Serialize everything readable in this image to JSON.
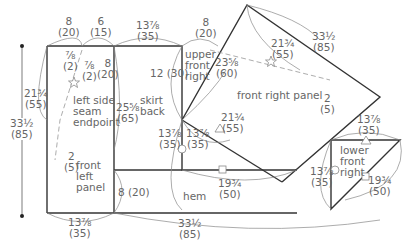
{
  "diagram": {
    "type": "sewing-pattern",
    "panels": {
      "front_left": "front\nleft\npanel",
      "skirt_back": "skirt\nback",
      "upper_front_right": "upper\nfront\nright",
      "front_right": "front right panel",
      "lower_front_right": "lower\nfront\nright",
      "hem": "hem",
      "left_side_seam": "left side\nseam\nendpoint"
    },
    "measurements": {
      "top_left_width": "8\n(20)",
      "top_mid_width": "6\n(15)",
      "top_back_width": "13⅞\n(35)",
      "top_upper_right_width": "8\n(20)",
      "dart_left": "⅞\n(2)",
      "dart_right": "⅞\n(2)",
      "back_upper_height": "8\n(20)",
      "left_panel_height": "21¾\n(55)",
      "total_height": "33½\n(85)",
      "seam_offset": "2\n(5)",
      "back_side_length": "25⅝\n(65)",
      "upper_right_height": "12 (30)",
      "diagonal_upper": "23⅝\n(60)",
      "front_right_inner": "21¾\n(55)",
      "front_right_outer": "33½\n(85)",
      "front_right_offset": "2\n(5)",
      "diag_lower_a": "21¾\n(55)",
      "circle_left": "13⅞\n(35)",
      "circle_right": "13⅞\n(35)",
      "square_width": "19¾\n(50)",
      "hem_height": "8 (20)",
      "bottom_left_width": "13⅞\n(35)",
      "bottom_total_width": "33½\n(85)",
      "lower_top_width": "13⅞\n(35)",
      "lower_left_height": "13⅞\n(35)",
      "lower_diag": "19¾\n(50)"
    },
    "symbols": [
      "star-marker",
      "triangle-marker",
      "circle-marker",
      "square-marker"
    ],
    "colors": {
      "edge": "#333333",
      "guide": "#888888",
      "text": "#666666"
    }
  }
}
